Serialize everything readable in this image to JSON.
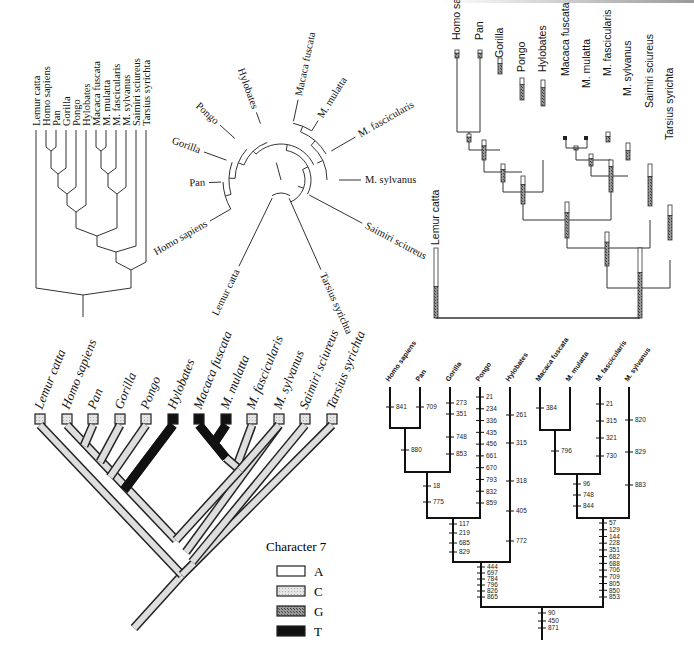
{
  "taxa": [
    "Lemur catta",
    "Homo sapiens",
    "Pan",
    "Gorilla",
    "Pongo",
    "Hylobates",
    "Macaca fuscata",
    "M. mulatta",
    "M. fascicularis",
    "M. sylvanus",
    "Saimiri sciureus",
    "Tarsius syrichta"
  ],
  "panels": {
    "rectangular_cladogram": {
      "labels": [
        "Lemur catta",
        "Homo sapiens",
        "Pan",
        "Gorilla",
        "Pongo",
        "Hylobates",
        "Macaca fuscata",
        "M. mulatta",
        "M. fascicularis",
        "M. sylvanus",
        "Saimiri sciureus",
        "Tarsius syrichta"
      ]
    },
    "circular_tree": {
      "labels": [
        "Homo sapiens",
        "Pan",
        "Gorilla",
        "Pongo",
        "Hylobates",
        "Macaca fuscata",
        "M. mulatta",
        "M. fascicularis",
        "M. sylvanus",
        "Saimiri sciureus",
        "Tarsius syrichta",
        "Lemur catta"
      ]
    },
    "bar_tree": {
      "labels": [
        "Lemur catta",
        "Homo sapiens",
        "Pan",
        "Gorilla",
        "Pongo",
        "Hylobates",
        "Macaca fuscata",
        "M. mulatta",
        "M. fascicularis",
        "M. sylvanus",
        "Saimiri sciureus",
        "Tarsius syrichta"
      ]
    },
    "character_tree": {
      "labels": [
        "Lemur catta",
        "Homo sapiens",
        "Pan",
        "Gorilla",
        "Pongo",
        "Hylobates",
        "Macaca fuscata",
        "M. mulatta",
        "M. fascicularis",
        "M. sylvanus",
        "Saimiri sciureus",
        "Tarsius syrichta"
      ],
      "tip_states": [
        "C",
        "C",
        "C",
        "C",
        "C",
        "T",
        "T",
        "T",
        "C",
        "C",
        "C",
        "C"
      ],
      "legend": {
        "title": "Character 7",
        "items": [
          {
            "state": "A",
            "color": "#ffffff"
          },
          {
            "state": "C",
            "color": "#d8d8d8"
          },
          {
            "state": "G",
            "color": "#8a8a8a"
          },
          {
            "state": "T",
            "color": "#111111"
          }
        ]
      }
    },
    "site_tree": {
      "labels": [
        "Homo sapiens",
        "Pan",
        "Gorilla",
        "Pongo",
        "Hylobates",
        "Macaca fuscata",
        "M. mulatta",
        "M. fascicularis",
        "M. sylvanus"
      ],
      "branch_sites": {
        "homo": [
          "841"
        ],
        "pan": [
          "709"
        ],
        "homo_pan": [
          "880"
        ],
        "gorilla": [
          "273",
          "351",
          "748",
          "853"
        ],
        "hpg": [
          "18",
          "775"
        ],
        "pongo": [
          "21",
          "234",
          "336",
          "435",
          "456",
          "661",
          "670",
          "793",
          "832",
          "859"
        ],
        "hpgp": [
          "117",
          "219",
          "685",
          "829"
        ],
        "hylobates": [
          "261",
          "315",
          "318",
          "405",
          "772"
        ],
        "hominoid": [
          "444",
          "697",
          "784",
          "796",
          "826",
          "865"
        ],
        "macaca": [
          "384"
        ],
        "mf_mm": [
          "796"
        ],
        "fascicularis": [
          "21",
          "315",
          "321",
          "730"
        ],
        "mmf": [
          "96",
          "748",
          "844"
        ],
        "sylvanus": [
          "820",
          "829",
          "883"
        ],
        "cercopith": [
          "57",
          "129",
          "144",
          "228",
          "351",
          "682",
          "688",
          "706",
          "709",
          "805",
          "850",
          "853"
        ],
        "root": [
          "90",
          "450",
          "871"
        ]
      }
    }
  }
}
